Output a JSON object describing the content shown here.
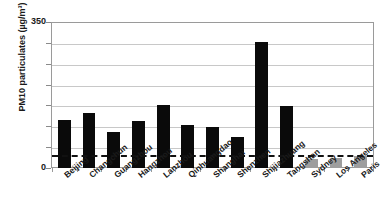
{
  "chart_data": {
    "type": "bar",
    "title": "",
    "subtitle": "",
    "xlabel": "",
    "ylabel": "PM10 particulates (µg/m³)",
    "ylim": [
      0,
      350
    ],
    "ytick_labels": [
      "350",
      "0"
    ],
    "ytick_values": [
      350,
      0
    ],
    "ygrid_values": [
      350,
      300,
      250,
      200,
      150,
      100,
      50,
      0
    ],
    "grid": true,
    "legend": "none",
    "categories": [
      "Beijing",
      "Changchun",
      "Guangzhou",
      "Hangzhou",
      "Lanzhou",
      "Qinhuangdao",
      "Shanghai",
      "Shenzhen",
      "Shijiazhuang",
      "Tangshan",
      "Sydney",
      "Los Angeles",
      "Paris"
    ],
    "values": [
      115,
      131,
      86,
      113,
      150,
      103,
      98,
      75,
      302,
      148,
      22,
      25,
      28
    ],
    "bar_colors": [
      "#0a0a0a",
      "#0a0a0a",
      "#0a0a0a",
      "#0a0a0a",
      "#0a0a0a",
      "#0a0a0a",
      "#0a0a0a",
      "#0a0a0a",
      "#0a0a0a",
      "#0a0a0a",
      "#9e9e9e",
      "#9e9e9e",
      "#9e9e9e"
    ],
    "reference_line": {
      "value": 32,
      "style": "dashed",
      "color": "#111111"
    },
    "colors": {
      "bar_dark": "#0a0a0a",
      "bar_gray": "#9e9e9e",
      "gridline": "#c8c8c8",
      "axis": "#9a9a9a",
      "text": "#1a1a1a",
      "background": "#ffffff"
    }
  }
}
